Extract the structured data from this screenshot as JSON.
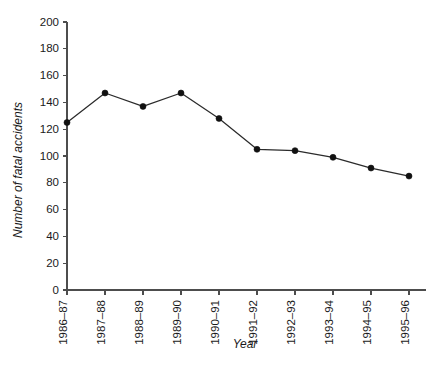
{
  "chart_data": {
    "type": "line",
    "title": "",
    "xlabel": "Year",
    "ylabel": "Number of fatal accidents",
    "categories": [
      "1986–87",
      "1987–88",
      "1988–89",
      "1989–90",
      "1990–91",
      "1991–92",
      "1992–93",
      "1993–94",
      "1994–95",
      "1995–96"
    ],
    "values": [
      125,
      147,
      137,
      147,
      128,
      105,
      104,
      99,
      91,
      85
    ],
    "series": [
      {
        "name": "Number of fatal accidents",
        "values": [
          125,
          147,
          137,
          147,
          128,
          105,
          104,
          99,
          91,
          85
        ]
      }
    ],
    "ylim": [
      0,
      200
    ],
    "ytick_values": [
      0,
      20,
      40,
      60,
      80,
      100,
      120,
      140,
      160,
      180,
      200
    ],
    "ytick_labels": [
      "0",
      "20",
      "40",
      "60",
      "80",
      "100",
      "120",
      "140",
      "160",
      "180",
      "200"
    ],
    "grid": false,
    "legend": false,
    "legend_position": "none",
    "marker": "filled-circle",
    "line_color": "#2b2b2b",
    "marker_color": "#111111",
    "axis_color": "#4d4d4d",
    "background_color": "#ffffff",
    "xtick_rotation": -90
  }
}
